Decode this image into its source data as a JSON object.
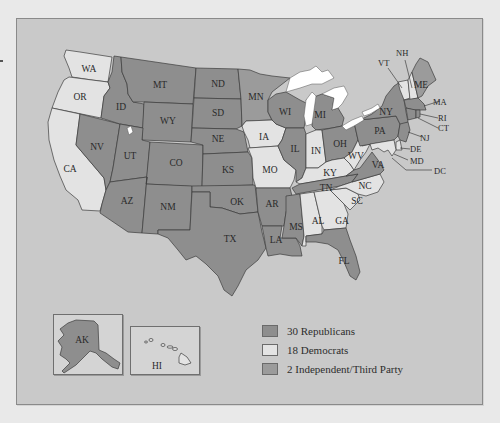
{
  "colors": {
    "republican": "#8e8e8e",
    "democrat": "#e3e3e3",
    "independent": "#9b9b9b",
    "frame_bg": "#c9c9c9",
    "page_bg": "#e9e9e9",
    "lakes": "#ffffff"
  },
  "legend": {
    "items": [
      {
        "key": "republican",
        "label": "30 Republicans",
        "count": 30
      },
      {
        "key": "democrat",
        "label": "18 Democrats",
        "count": 18
      },
      {
        "key": "independent",
        "label": "2 Independent/Third Party",
        "count": 2
      }
    ]
  },
  "insets": {
    "alaska": {
      "label": "AK",
      "party": "republican"
    },
    "hawaii": {
      "label": "HI",
      "party": "democrat"
    }
  },
  "states": {
    "WA": {
      "label": "WA",
      "party": "democrat"
    },
    "OR": {
      "label": "OR",
      "party": "democrat"
    },
    "CA": {
      "label": "CA",
      "party": "democrat"
    },
    "NV": {
      "label": "NV",
      "party": "republican"
    },
    "ID": {
      "label": "ID",
      "party": "republican"
    },
    "MT": {
      "label": "MT",
      "party": "republican"
    },
    "WY": {
      "label": "WY",
      "party": "republican"
    },
    "UT": {
      "label": "UT",
      "party": "republican"
    },
    "CO": {
      "label": "CO",
      "party": "republican"
    },
    "AZ": {
      "label": "AZ",
      "party": "republican"
    },
    "NM": {
      "label": "NM",
      "party": "republican"
    },
    "ND": {
      "label": "ND",
      "party": "republican"
    },
    "SD": {
      "label": "SD",
      "party": "republican"
    },
    "NE": {
      "label": "NE",
      "party": "republican"
    },
    "KS": {
      "label": "KS",
      "party": "republican"
    },
    "OK": {
      "label": "OK",
      "party": "republican"
    },
    "TX": {
      "label": "TX",
      "party": "republican"
    },
    "MN": {
      "label": "MN",
      "party": "independent"
    },
    "IA": {
      "label": "IA",
      "party": "democrat"
    },
    "MO": {
      "label": "MO",
      "party": "democrat"
    },
    "AR": {
      "label": "AR",
      "party": "republican"
    },
    "LA": {
      "label": "LA",
      "party": "republican"
    },
    "WI": {
      "label": "WI",
      "party": "republican"
    },
    "IL": {
      "label": "IL",
      "party": "republican"
    },
    "MI": {
      "label": "MI",
      "party": "republican"
    },
    "IN": {
      "label": "IN",
      "party": "democrat"
    },
    "OH": {
      "label": "OH",
      "party": "republican"
    },
    "KY": {
      "label": "KY",
      "party": "democrat"
    },
    "TN": {
      "label": "TN",
      "party": "republican"
    },
    "MS": {
      "label": "MS",
      "party": "republican"
    },
    "AL": {
      "label": "AL",
      "party": "democrat"
    },
    "GA": {
      "label": "GA",
      "party": "democrat"
    },
    "FL": {
      "label": "FL",
      "party": "republican"
    },
    "SC": {
      "label": "SC",
      "party": "democrat"
    },
    "NC": {
      "label": "NC",
      "party": "democrat"
    },
    "VA": {
      "label": "VA",
      "party": "republican"
    },
    "WV": {
      "label": "WV",
      "party": "democrat"
    },
    "PA": {
      "label": "PA",
      "party": "republican"
    },
    "NY": {
      "label": "NY",
      "party": "republican"
    },
    "VT": {
      "label": "VT",
      "party": "democrat"
    },
    "NH": {
      "label": "NH",
      "party": "democrat"
    },
    "ME": {
      "label": "ME",
      "party": "independent"
    },
    "MA": {
      "label": "MA",
      "party": "republican"
    },
    "RI": {
      "label": "RI",
      "party": "republican"
    },
    "CT": {
      "label": "CT",
      "party": "republican"
    },
    "NJ": {
      "label": "NJ",
      "party": "republican"
    },
    "DE": {
      "label": "DE",
      "party": "democrat"
    },
    "MD": {
      "label": "MD",
      "party": "democrat"
    },
    "DC": {
      "label": "DC",
      "party": "democrat"
    }
  }
}
